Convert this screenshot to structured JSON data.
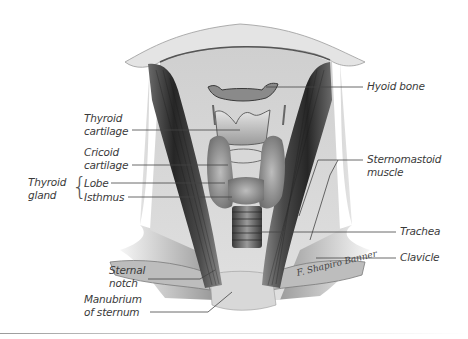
{
  "figure": {
    "signature": "F. Shapiro Banner"
  },
  "labels": {
    "left": {
      "thyroid_cartilage": {
        "line1": "Thyroid",
        "line2": "cartilage"
      },
      "cricoid_cartilage": {
        "line1": "Cricoid",
        "line2": "cartilage"
      },
      "thyroid_gland": {
        "line1": "Thyroid",
        "line2": "gland",
        "lobe": "Lobe",
        "isthmus": "Isthmus"
      },
      "sternal_notch": {
        "line1": "Sternal",
        "line2": "notch"
      },
      "manubrium": {
        "line1": "Manubrium",
        "line2": "of sternum"
      }
    },
    "right": {
      "hyoid_bone": "Hyoid bone",
      "sternomastoid": {
        "line1": "Sternomastoid",
        "line2": "muscle"
      },
      "trachea": "Trachea",
      "clavicle": "Clavicle"
    }
  },
  "colors": {
    "label_text": "#3a3a3a",
    "leader_line": "#444444",
    "background_tissue": "#d6d6d6",
    "muscle_dark": "#2e2e2e",
    "skin_edge": "#e8e8e8"
  }
}
